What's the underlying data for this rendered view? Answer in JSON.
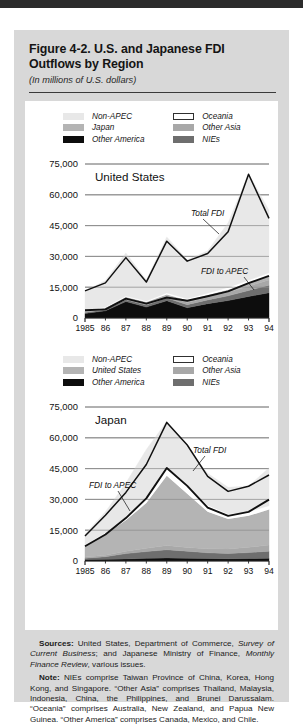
{
  "figure": {
    "title": "Figure 4-2.  U.S. and Japanese FDI Outflows by Region",
    "title_line1": "Figure 4-2.  U.S. and Japanese FDI",
    "title_line2": "Outflows by Region",
    "units": "(In millions of U.S. dollars)"
  },
  "notes": {
    "sources_label": "Sources:",
    "sources_text_a": "  United States, Department of Commerce, ",
    "sources_italic_a": "Survey of Current Business",
    "sources_text_b": "; and Japanese Ministry of Finance, ",
    "sources_italic_b": "Monthly Finance Review",
    "sources_text_c": ", various issues.",
    "note_label": "Note:",
    "note_text": "  NIEs comprise Taiwan Province of China, Korea, Hong Kong, and Singapore. “Other Asia” comprises Thailand, Malaysia, Indonesia, China, the Philippines, and Brunei Darussalam. “Oceania” comprises Australia, New Zealand, and Papua New Guinea. “Other America” comprises Canada, Mexico, and Chile."
  },
  "colors": {
    "non_apec": "#e8e8e8",
    "country_mid": "#b4b4b4",
    "other_america": "#0d0d0d",
    "oceania": "#ffffff",
    "other_asia": "#a8a8a8",
    "nies": "#6e6e6e",
    "gridline": "#8e8e8e",
    "axis": "#262626",
    "frame": "#d8d8d8",
    "band": "#2b2b2b"
  },
  "chart_data": [
    {
      "type": "area",
      "id": "united-states",
      "title": "United States",
      "xlabel": "",
      "ylabel": "",
      "ylim": [
        0,
        75000
      ],
      "yticks": [
        0,
        15000,
        30000,
        45000,
        60000,
        75000
      ],
      "ytick_labels": [
        "0",
        "15,000",
        "30,000",
        "45,000",
        "60,000",
        "75,000"
      ],
      "grid": true,
      "legend_position": "above",
      "x": [
        1985,
        1986,
        1987,
        1988,
        1989,
        1990,
        1991,
        1992,
        1993,
        1994
      ],
      "xtick_labels": [
        "1985",
        "86",
        "87",
        "88",
        "89",
        "90",
        "91",
        "92",
        "93",
        "94"
      ],
      "annotations": [
        {
          "text": "Total FDI",
          "series": "Total FDI"
        },
        {
          "text": "FDI to APEC",
          "series": "FDI to APEC"
        }
      ],
      "series": [
        {
          "name": "Non-APEC",
          "color": "#e8e8e8",
          "values": [
            9400,
            12900,
            21000,
            10200,
            27300,
            19000,
            20600,
            31500,
            52000,
            30500
          ]
        },
        {
          "name": "Oceania",
          "color": "#ffffff",
          "values": [
            300,
            350,
            500,
            500,
            700,
            800,
            900,
            1100,
            1400,
            1700
          ]
        },
        {
          "name": "Japan",
          "color": "#b4b4b4",
          "values": [
            400,
            500,
            700,
            800,
            900,
            1000,
            1100,
            1300,
            1500,
            1800
          ]
        },
        {
          "name": "Other Asia",
          "color": "#a8a8a8",
          "values": [
            300,
            400,
            600,
            700,
            900,
            1100,
            1300,
            1700,
            2100,
            2600
          ]
        },
        {
          "name": "NIEs",
          "color": "#6e6e6e",
          "values": [
            500,
            600,
            900,
            1000,
            1300,
            1500,
            1800,
            2300,
            2900,
            3600
          ]
        },
        {
          "name": "Other America",
          "color": "#0d0d0d",
          "values": [
            2200,
            3500,
            8000,
            5300,
            8400,
            5000,
            7000,
            8500,
            10500,
            12300
          ]
        }
      ],
      "total_fdi": [
        13200,
        17100,
        29400,
        17500,
        37400,
        27700,
        31400,
        42000,
        70000,
        48500
      ],
      "fdi_to_apec": [
        3800,
        4200,
        9400,
        7000,
        10000,
        8400,
        10600,
        13000,
        17000,
        20500
      ]
    },
    {
      "type": "area",
      "id": "japan",
      "title": "Japan",
      "xlabel": "",
      "ylabel": "",
      "ylim": [
        0,
        75000
      ],
      "yticks": [
        0,
        15000,
        30000,
        45000,
        60000,
        75000
      ],
      "ytick_labels": [
        "0",
        "15,000",
        "30,000",
        "45,000",
        "60,000",
        "75,000"
      ],
      "grid": true,
      "legend_position": "above",
      "x": [
        1985,
        1986,
        1987,
        1988,
        1989,
        1990,
        1991,
        1992,
        1993,
        1994
      ],
      "xtick_labels": [
        "1985",
        "86",
        "87",
        "88",
        "89",
        "90",
        "91",
        "92",
        "93",
        "94"
      ],
      "annotations": [
        {
          "text": "Total FDI",
          "series": "Total FDI"
        },
        {
          "text": "FDI to APEC",
          "series": "FDI to APEC"
        }
      ],
      "series": [
        {
          "name": "Non-APEC",
          "color": "#e8e8e8",
          "values": [
            5300,
            10200,
            17000,
            23500,
            22300,
            18700,
            15500,
            13000,
            12500,
            18500
          ]
        },
        {
          "name": "Oceania",
          "color": "#ffffff",
          "values": [
            600,
            900,
            1200,
            2600,
            4200,
            4000,
            3200,
            2400,
            2000,
            1800
          ]
        },
        {
          "name": "United States",
          "color": "#b4b4b4",
          "values": [
            5400,
            10100,
            15000,
            22000,
            33900,
            26100,
            18000,
            14600,
            15300,
            17300
          ]
        },
        {
          "name": "Other Asia",
          "color": "#a8a8a8",
          "values": [
            500,
            700,
            1200,
            1600,
            2100,
            1800,
            2000,
            2200,
            2600,
            3000
          ]
        },
        {
          "name": "NIEs",
          "color": "#6e6e6e",
          "values": [
            700,
            1300,
            2600,
            3300,
            4000,
            3400,
            2800,
            2600,
            2900,
            3400
          ]
        },
        {
          "name": "Other America",
          "color": "#0d0d0d",
          "values": [
            700,
            800,
            1000,
            1300,
            1500,
            1400,
            1200,
            1100,
            1200,
            1400
          ]
        }
      ],
      "total_fdi": [
        12200,
        22300,
        33400,
        47000,
        67500,
        56500,
        41200,
        33900,
        36400,
        41900
      ],
      "fdi_to_apec": [
        7200,
        12900,
        20900,
        30500,
        45300,
        36600,
        26000,
        22000,
        23900,
        29900
      ]
    }
  ],
  "legends": [
    {
      "chart": "united-states",
      "left": [
        {
          "label": "Non-APEC",
          "swatch": "non_apec",
          "icon": "legend-swatch"
        },
        {
          "label": "Japan",
          "swatch": "country_mid",
          "icon": "legend-swatch"
        },
        {
          "label": "Other America",
          "swatch": "other_america",
          "icon": "legend-swatch"
        }
      ],
      "right": [
        {
          "label": "Oceania",
          "swatch": "oceania",
          "icon": "legend-swatch"
        },
        {
          "label": "Other Asia",
          "swatch": "other_asia",
          "icon": "legend-swatch"
        },
        {
          "label": "NIEs",
          "swatch": "nies",
          "icon": "legend-swatch"
        }
      ]
    },
    {
      "chart": "japan",
      "left": [
        {
          "label": "Non-APEC",
          "swatch": "non_apec",
          "icon": "legend-swatch"
        },
        {
          "label": "United States",
          "swatch": "country_mid",
          "icon": "legend-swatch"
        },
        {
          "label": "Other America",
          "swatch": "other_america",
          "icon": "legend-swatch"
        }
      ],
      "right": [
        {
          "label": "Oceania",
          "swatch": "oceania",
          "icon": "legend-swatch"
        },
        {
          "label": "Other Asia",
          "swatch": "other_asia",
          "icon": "legend-swatch"
        },
        {
          "label": "NIEs",
          "swatch": "nies",
          "icon": "legend-swatch"
        }
      ]
    }
  ]
}
